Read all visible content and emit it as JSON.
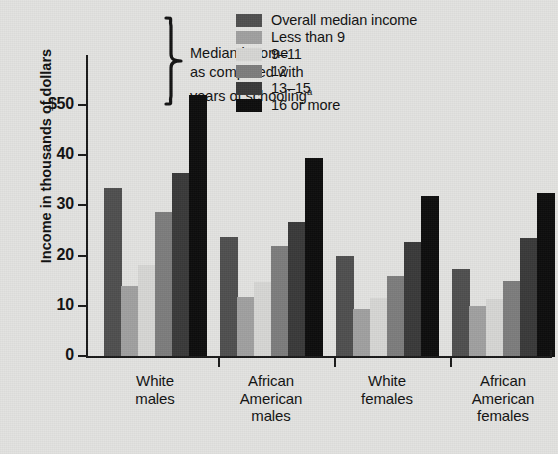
{
  "chart_data": {
    "type": "bar",
    "title": "",
    "xlabel": "",
    "ylabel": "Income in thousands of dollars",
    "ylim": [
      0,
      55
    ],
    "yticks": [
      0,
      10,
      20,
      30,
      40,
      50
    ],
    "ytick_labels": [
      "0",
      "10",
      "20",
      "30",
      "40",
      "$50"
    ],
    "grid": false,
    "legend_position": "top-center",
    "legend_note": "Median income as compared with years of schooling",
    "legend_note_superscript": "a",
    "legend_note_lines": [
      "Median income",
      "as compared with",
      "years of schooling"
    ],
    "categories": [
      "White males",
      "African American males",
      "White females",
      "African American females"
    ],
    "category_lines": [
      [
        "White",
        "males"
      ],
      [
        "African",
        "American",
        "males"
      ],
      [
        "White",
        "females"
      ],
      [
        "African",
        "American",
        "females"
      ]
    ],
    "series": [
      {
        "name": "Overall median income",
        "color": "#4f4f4f",
        "values": [
          33.6,
          24.0,
          20.2,
          17.5
        ]
      },
      {
        "name": "Less than 9",
        "color": "#a0a0a0",
        "values": [
          14.2,
          12.0,
          9.5,
          10.1
        ]
      },
      {
        "name": "9–11",
        "color": "#d6d6d4",
        "values": [
          18.4,
          15.0,
          11.8,
          11.5
        ]
      },
      {
        "name": "12",
        "color": "#7d7d7d",
        "values": [
          28.9,
          22.1,
          16.2,
          15.1
        ]
      },
      {
        "name": "13–15",
        "color": "#3a3a3a",
        "values": [
          36.6,
          26.9,
          22.9,
          23.8
        ]
      },
      {
        "name": "16 or more",
        "color": "#0d0d0d",
        "values": [
          52.2,
          39.6,
          32.1,
          32.6
        ]
      }
    ]
  },
  "axis": {
    "y_title": "Income in thousands of dollars"
  },
  "legend": {
    "items": [
      {
        "label": "Overall median income",
        "color": "#4f4f4f"
      },
      {
        "label": "Less than 9",
        "color": "#a0a0a0"
      },
      {
        "label": "9–11",
        "color": "#d6d6d4"
      },
      {
        "label": "12",
        "color": "#7d7d7d"
      },
      {
        "label": "13–15",
        "color": "#3a3a3a"
      },
      {
        "label": "16 or more",
        "color": "#0d0d0d"
      }
    ],
    "note_line_1": "Median income",
    "note_line_2": "as compared with",
    "note_line_3": "years of schooling",
    "note_superscript": "a"
  }
}
